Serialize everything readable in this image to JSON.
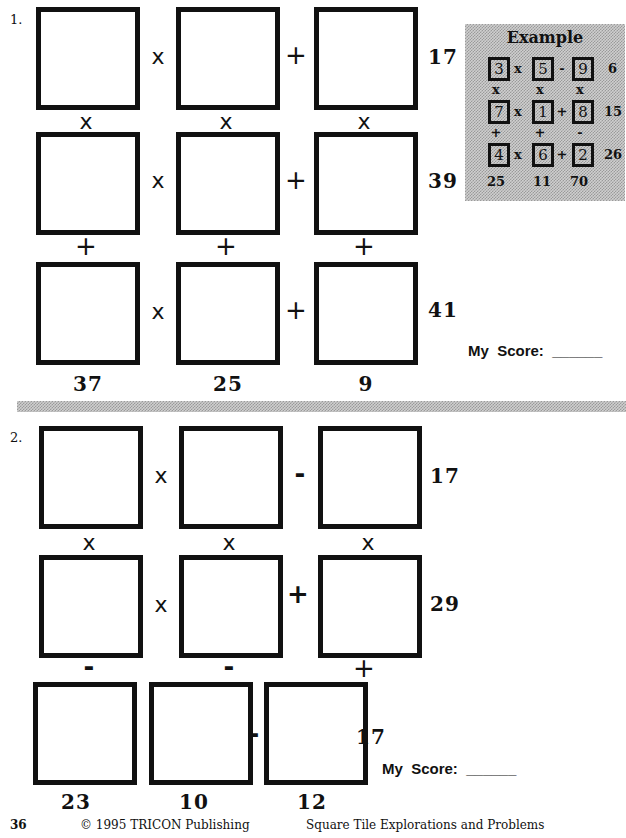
{
  "problems": [
    {
      "number": "1.",
      "rows": [
        {
          "ops": [
            "x",
            "+"
          ],
          "result": "17"
        },
        {
          "ops": [
            "x",
            "+"
          ],
          "result": "39"
        },
        {
          "ops": [
            "x",
            "+"
          ],
          "result": "41"
        }
      ],
      "vertical_ops": [
        [
          "x",
          "x",
          "x"
        ],
        [
          "+",
          "+",
          "+"
        ]
      ],
      "column_results": [
        "37",
        "25",
        "9"
      ],
      "score_label": "My  Score:  ______"
    },
    {
      "number": "2.",
      "rows": [
        {
          "ops": [
            "x",
            "-"
          ],
          "result": "17"
        },
        {
          "ops": [
            "x",
            "+"
          ],
          "result": "29"
        },
        {
          "ops": [
            "x",
            "-"
          ],
          "result": "17"
        }
      ],
      "vertical_ops": [
        [
          "x",
          "x",
          "x"
        ],
        [
          "-",
          "-",
          "+"
        ]
      ],
      "column_results": [
        "23",
        "10",
        "12"
      ],
      "score_label": "My  Score:  ______"
    }
  ],
  "example": {
    "title": "Example",
    "grid": [
      [
        "3",
        "5",
        "9"
      ],
      [
        "7",
        "1",
        "8"
      ],
      [
        "4",
        "6",
        "2"
      ]
    ],
    "row_ops": [
      [
        "x",
        "-"
      ],
      [
        "x",
        "+"
      ],
      [
        "x",
        "+"
      ]
    ],
    "row_results": [
      "6",
      "15",
      "26"
    ],
    "vertical_ops": [
      [
        "x",
        "x",
        "x"
      ],
      [
        "+",
        "+",
        "-"
      ]
    ],
    "column_results": [
      "25",
      "11",
      "70"
    ]
  },
  "footer": {
    "page_number": "36",
    "copyright": "© 1995  TRICON Publishing",
    "book_title": "Square Tile Explorations and Problems"
  },
  "colors": {
    "ink": "#111111",
    "panel_gray": "#cfcfcf",
    "background": "#ffffff"
  }
}
